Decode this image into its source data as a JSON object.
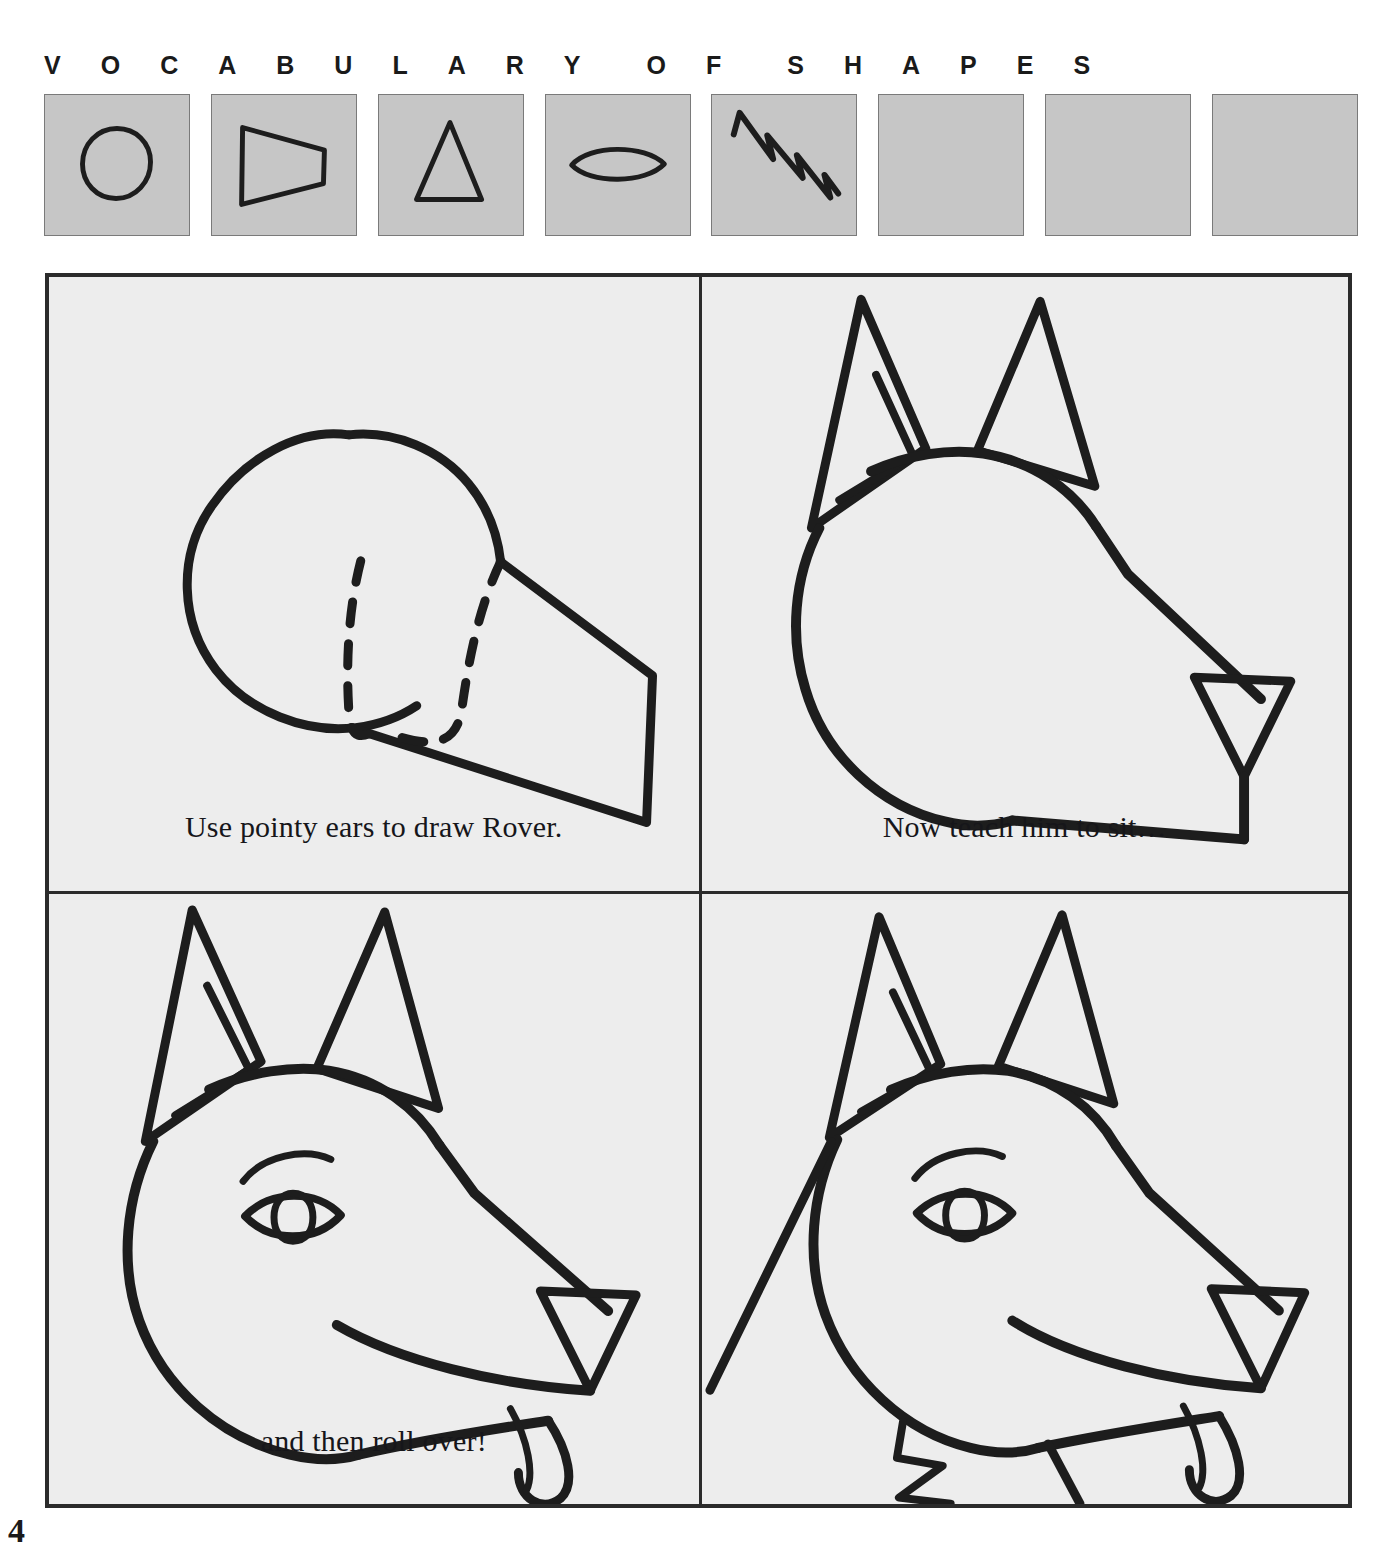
{
  "header": {
    "letters_word1": [
      "V",
      "O",
      "C",
      "A",
      "B",
      "U",
      "L",
      "A",
      "R",
      "Y"
    ],
    "letters_word2": [
      "O",
      "F"
    ],
    "letters_word3": [
      "S",
      "H",
      "A",
      "P",
      "E",
      "S"
    ]
  },
  "shape_strip": {
    "box_fill": "#c6c6c6",
    "box_border": "#7a7a7a",
    "boxes": [
      {
        "name": "circle",
        "icon": "circle-shape",
        "filled": true
      },
      {
        "name": "trapezoid",
        "icon": "trapezoid-shape",
        "filled": true
      },
      {
        "name": "triangle",
        "icon": "triangle-shape",
        "filled": true
      },
      {
        "name": "lens-oval",
        "icon": "lens-shape",
        "filled": true
      },
      {
        "name": "zigzag",
        "icon": "zigzag-shape",
        "filled": true
      },
      {
        "name": "empty-1",
        "icon": "empty-shape",
        "filled": false
      },
      {
        "name": "empty-2",
        "icon": "empty-shape",
        "filled": false
      },
      {
        "name": "empty-3",
        "icon": "empty-shape",
        "filled": false
      }
    ]
  },
  "panels": [
    {
      "id": "panel-construction",
      "caption": "Use pointy ears to draw Rover.",
      "art": "circle head plus trapezoid muzzle with dashed hidden edge"
    },
    {
      "id": "panel-ears",
      "caption": "Now teach him to sit…",
      "art": "dog head with two pointy triangle ears and triangle nose"
    },
    {
      "id": "panel-face",
      "caption": "and then roll over!",
      "art": "dog head with eye, brow, nose, mouth and tongue"
    },
    {
      "id": "panel-body",
      "caption": "",
      "art": "dog head with eye, tongue, zigzag collar ruff and neck lines"
    }
  ],
  "page": {
    "number": "4"
  },
  "colors": {
    "paper": "#ffffff",
    "panel_background": "#ededed",
    "swatch_gray": "#c6c6c6",
    "ink": "#1d1d1d",
    "frame": "#2b2b2b"
  }
}
